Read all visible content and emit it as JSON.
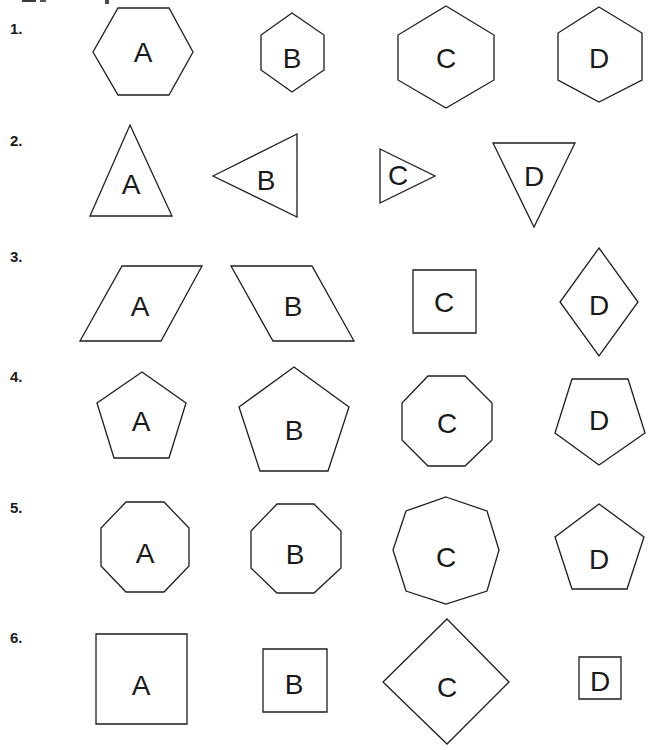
{
  "worksheet": {
    "clipped_heading_fragment": "",
    "style": {
      "stroke_color": "#1e1e1e",
      "text_color": "#1a1a1a",
      "background": "#ffffff"
    },
    "rows": [
      {
        "number_label": "1.",
        "label_pos": [
          10,
          34
        ],
        "shapes": [
          {
            "letter": "A",
            "kind": "hexagon-flat",
            "points": [
              [
                118,
                8
              ],
              [
                169,
                8
              ],
              [
                193,
                52
              ],
              [
                169,
                95
              ],
              [
                118,
                95
              ],
              [
                93,
                52
              ]
            ],
            "text_pos": [
              143,
              52
            ]
          },
          {
            "letter": "B",
            "kind": "hexagon-pointy",
            "points": [
              [
                292,
                13
              ],
              [
                324,
                35
              ],
              [
                324,
                70
              ],
              [
                292,
                92
              ],
              [
                261,
                70
              ],
              [
                261,
                35
              ]
            ],
            "text_pos": [
              292,
              58
            ]
          },
          {
            "letter": "C",
            "kind": "hexagon-pointy",
            "points": [
              [
                446,
                6
              ],
              [
                494,
                35
              ],
              [
                494,
                80
              ],
              [
                446,
                108
              ],
              [
                398,
                80
              ],
              [
                398,
                35
              ]
            ],
            "text_pos": [
              446,
              58
            ]
          },
          {
            "letter": "D",
            "kind": "hexagon-pointy",
            "points": [
              [
                599,
                7
              ],
              [
                642,
                33
              ],
              [
                642,
                80
              ],
              [
                599,
                102
              ],
              [
                558,
                80
              ],
              [
                558,
                33
              ]
            ],
            "text_pos": [
              599,
              58
            ]
          }
        ]
      },
      {
        "number_label": "2.",
        "label_pos": [
          10,
          146
        ],
        "shapes": [
          {
            "letter": "A",
            "kind": "triangle-up",
            "points": [
              [
                130,
                125
              ],
              [
                172,
                216
              ],
              [
                90,
                216
              ]
            ],
            "text_pos": [
              131,
              184
            ]
          },
          {
            "letter": "B",
            "kind": "triangle-left",
            "points": [
              [
                213,
                176
              ],
              [
                297,
                134
              ],
              [
                297,
                217
              ]
            ],
            "text_pos": [
              266,
              180
            ]
          },
          {
            "letter": "C",
            "kind": "triangle-right",
            "points": [
              [
                380,
                149
              ],
              [
                435,
                176
              ],
              [
                380,
                203
              ]
            ],
            "text_pos": [
              398,
              175
            ]
          },
          {
            "letter": "D",
            "kind": "triangle-down",
            "points": [
              [
                493,
                143
              ],
              [
                575,
                143
              ],
              [
                534,
                227
              ]
            ],
            "text_pos": [
              534,
              176
            ]
          }
        ]
      },
      {
        "number_label": "3.",
        "label_pos": [
          10,
          262
        ],
        "shapes": [
          {
            "letter": "A",
            "kind": "parallelogram-right",
            "points": [
              [
                122,
                266
              ],
              [
                202,
                266
              ],
              [
                161,
                341
              ],
              [
                80,
                341
              ]
            ],
            "text_pos": [
              140,
              306
            ]
          },
          {
            "letter": "B",
            "kind": "parallelogram-left",
            "points": [
              [
                231,
                266
              ],
              [
                312,
                266
              ],
              [
                354,
                341
              ],
              [
                273,
                341
              ]
            ],
            "text_pos": [
              293,
              306
            ]
          },
          {
            "letter": "C",
            "kind": "square",
            "points": [
              [
                413,
                270
              ],
              [
                476,
                270
              ],
              [
                476,
                333
              ],
              [
                413,
                333
              ]
            ],
            "text_pos": [
              444,
              302
            ]
          },
          {
            "letter": "D",
            "kind": "rhombus",
            "points": [
              [
                599,
                248
              ],
              [
                638,
                302
              ],
              [
                599,
                356
              ],
              [
                560,
                302
              ]
            ],
            "text_pos": [
              599,
              305
            ]
          }
        ]
      },
      {
        "number_label": "4.",
        "label_pos": [
          10,
          382
        ],
        "shapes": [
          {
            "letter": "A",
            "kind": "pentagon",
            "points": [
              [
                142,
                372
              ],
              [
                186,
                403
              ],
              [
                169,
                458
              ],
              [
                114,
                458
              ],
              [
                97,
                403
              ]
            ],
            "text_pos": [
              141,
              421
            ]
          },
          {
            "letter": "B",
            "kind": "pentagon",
            "points": [
              [
                294,
                367
              ],
              [
                349,
                407
              ],
              [
                328,
                471
              ],
              [
                260,
                471
              ],
              [
                239,
                407
              ]
            ],
            "text_pos": [
              294,
              430
            ]
          },
          {
            "letter": "C",
            "kind": "octagon",
            "points": [
              [
                428,
                376
              ],
              [
                465,
                376
              ],
              [
                492,
                403
              ],
              [
                492,
                440
              ],
              [
                465,
                466
              ],
              [
                428,
                466
              ],
              [
                402,
                440
              ],
              [
                402,
                403
              ]
            ],
            "text_pos": [
              447,
              423
            ]
          },
          {
            "letter": "D",
            "kind": "pentagon-inverted",
            "points": [
              [
                572,
                379
              ],
              [
                628,
                379
              ],
              [
                645,
                433
              ],
              [
                599,
                465
              ],
              [
                555,
                433
              ]
            ],
            "text_pos": [
              599,
              420
            ]
          }
        ]
      },
      {
        "number_label": "5.",
        "label_pos": [
          10,
          513
        ],
        "shapes": [
          {
            "letter": "A",
            "kind": "octagon",
            "points": [
              [
                126,
                502
              ],
              [
                164,
                502
              ],
              [
                189,
                528
              ],
              [
                189,
                566
              ],
              [
                164,
                592
              ],
              [
                126,
                592
              ],
              [
                101,
                566
              ],
              [
                101,
                528
              ]
            ],
            "text_pos": [
              145,
              553
            ]
          },
          {
            "letter": "B",
            "kind": "octagon",
            "points": [
              [
                277,
                504
              ],
              [
                314,
                504
              ],
              [
                341,
                531
              ],
              [
                341,
                568
              ],
              [
                314,
                593
              ],
              [
                277,
                593
              ],
              [
                251,
                568
              ],
              [
                251,
                531
              ]
            ],
            "text_pos": [
              295,
              554
            ]
          },
          {
            "letter": "C",
            "kind": "octagon-rotated",
            "points": [
              [
                446,
                497
              ],
              [
                487,
                511
              ],
              [
                499,
                550
              ],
              [
                487,
                591
              ],
              [
                446,
                604
              ],
              [
                406,
                591
              ],
              [
                393,
                550
              ],
              [
                406,
                511
              ]
            ],
            "text_pos": [
              446,
              557
            ]
          },
          {
            "letter": "D",
            "kind": "pentagon",
            "points": [
              [
                599,
                504
              ],
              [
                644,
                537
              ],
              [
                627,
                589
              ],
              [
                572,
                589
              ],
              [
                555,
                537
              ]
            ],
            "text_pos": [
              599,
              559
            ]
          }
        ]
      },
      {
        "number_label": "6.",
        "label_pos": [
          10,
          643
        ],
        "shapes": [
          {
            "letter": "A",
            "kind": "square",
            "points": [
              [
                96,
                634
              ],
              [
                187,
                634
              ],
              [
                187,
                724
              ],
              [
                96,
                724
              ]
            ],
            "text_pos": [
              141,
              685
            ]
          },
          {
            "letter": "B",
            "kind": "square",
            "points": [
              [
                263,
                649
              ],
              [
                327,
                649
              ],
              [
                327,
                712
              ],
              [
                263,
                712
              ]
            ],
            "text_pos": [
              294,
              684
            ]
          },
          {
            "letter": "C",
            "kind": "diamond",
            "points": [
              [
                447,
                619
              ],
              [
                509,
                682
              ],
              [
                447,
                744
              ],
              [
                383,
                682
              ]
            ],
            "text_pos": [
              447,
              687
            ]
          },
          {
            "letter": "D",
            "kind": "square",
            "points": [
              [
                579,
                657
              ],
              [
                621,
                657
              ],
              [
                621,
                699
              ],
              [
                579,
                699
              ]
            ],
            "text_pos": [
              600,
              681
            ]
          }
        ]
      }
    ]
  }
}
